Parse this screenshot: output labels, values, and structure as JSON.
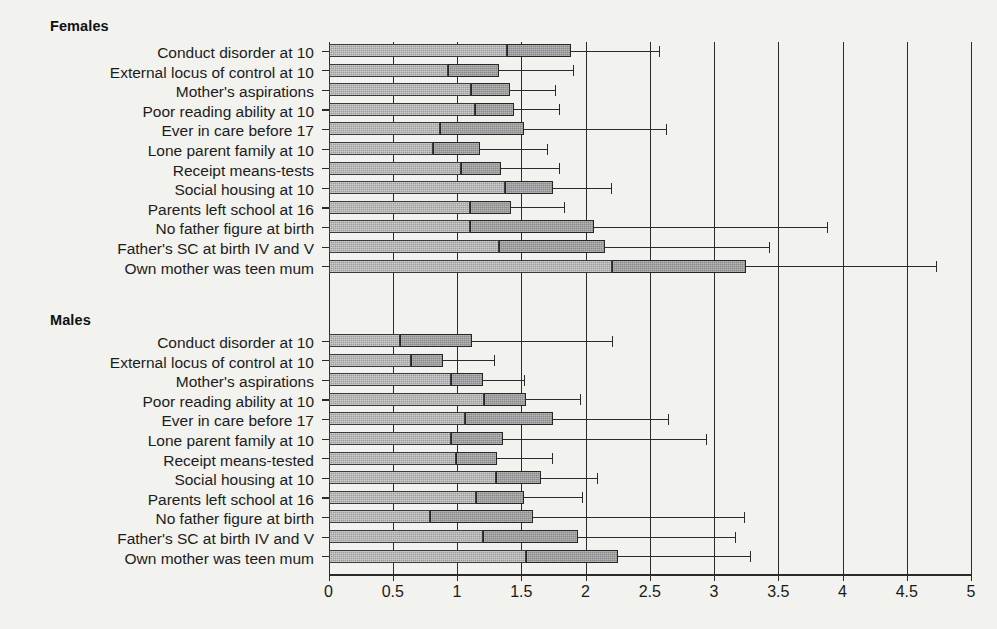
{
  "figure": {
    "groups": [
      {
        "name": "Females",
        "title": "Females"
      },
      {
        "name": "Males",
        "title": "Males"
      }
    ]
  },
  "axis": {
    "tick_labels": [
      "0",
      "0.5",
      "1",
      "1.5",
      "2",
      "2.5",
      "3",
      "3.5",
      "4",
      "4.5",
      "5"
    ],
    "min": 0,
    "max": 5,
    "step": 0.5
  },
  "chart_data": {
    "type": "bar",
    "title": "",
    "subtitle": "",
    "xlabel": "",
    "ylabel": "",
    "xlim": [
      0,
      5
    ],
    "xticks": [
      0,
      0.5,
      1,
      1.5,
      2,
      2.5,
      3,
      3.5,
      4,
      4.5,
      5
    ],
    "grid": true,
    "legend": "none",
    "orientation": "horizontal",
    "value_encoding": "Each row shows a horizontal bar from 0 to the lower confidence limit (light hatched), continuing as a darker hatched segment to the odds ratio point estimate, then a thin line whisker out to the upper confidence limit.",
    "groups": [
      {
        "name": "Females",
        "categories": [
          "Conduct disorder at 10",
          "External locus of control at 10",
          "Mother's aspirations",
          "Poor reading ability at 10",
          "Ever in care before 17",
          "Lone parent family at 10",
          "Receipt means-tests",
          "Social housing at 10",
          "Parents left school at 16",
          "No father figure at birth",
          "Father's SC at birth IV and V",
          "Own mother was teen mum"
        ],
        "ci_lower": [
          1.39,
          0.93,
          1.11,
          1.14,
          0.87,
          0.81,
          1.03,
          1.37,
          1.1,
          1.1,
          1.33,
          2.21
        ],
        "estimate": [
          1.89,
          1.33,
          1.41,
          1.44,
          1.52,
          1.18,
          1.34,
          1.75,
          1.42,
          2.07,
          2.15,
          3.25
        ],
        "ci_upper": [
          2.57,
          1.9,
          1.76,
          1.79,
          2.63,
          1.7,
          1.79,
          2.2,
          1.83,
          3.88,
          3.43,
          4.73
        ]
      },
      {
        "name": "Males",
        "categories": [
          "Conduct disorder at 10",
          "External locus of control at 10",
          "Mother's aspirations",
          "Poor reading ability at 10",
          "Ever in care before 17",
          "Lone parent family at 10",
          "Receipt means-tested",
          "Social housing at 10",
          "Parents left school at 16",
          "No father figure at birth",
          "Father's SC at birth IV and V",
          "Own mother was teen mum"
        ],
        "ci_lower": [
          0.56,
          0.64,
          0.95,
          1.21,
          1.06,
          0.95,
          0.99,
          1.3,
          1.15,
          0.79,
          1.2,
          1.54
        ],
        "estimate": [
          1.12,
          0.89,
          1.2,
          1.54,
          1.75,
          1.36,
          1.31,
          1.65,
          1.52,
          1.59,
          1.94,
          2.25
        ],
        "ci_upper": [
          2.21,
          1.29,
          1.52,
          1.96,
          2.64,
          2.94,
          1.74,
          2.09,
          1.97,
          3.23,
          3.16,
          3.28
        ]
      }
    ]
  },
  "colors": {
    "background": "#f2f2ee",
    "axis": "#2b2b2b",
    "bar_lower": "#9d9d9d",
    "bar_estimate": "#8a8a8a",
    "text": "#1a1a1a"
  }
}
